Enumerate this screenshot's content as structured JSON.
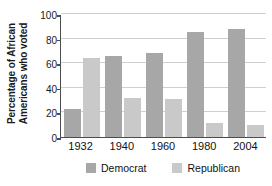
{
  "chart_data": {
    "type": "bar",
    "title": "",
    "xlabel": "",
    "ylabel": "Percentage of African Americans who voted",
    "ylabel_lines": [
      "Percentage of African",
      "Americans who voted"
    ],
    "categories": [
      "1932",
      "1940",
      "1960",
      "1980",
      "2004"
    ],
    "series": [
      {
        "name": "Democrat",
        "color": "#a7a7a7",
        "values": [
          23,
          66,
          68,
          85,
          88
        ]
      },
      {
        "name": "Republican",
        "color": "#c9c9c9",
        "values": [
          64,
          32,
          31,
          11,
          10
        ]
      }
    ],
    "ylim": [
      0,
      100
    ],
    "yticks": [
      0,
      20,
      40,
      60,
      80,
      100
    ],
    "ytick_labels": [
      "0",
      "20",
      "40",
      "60",
      "80",
      "100"
    ],
    "grid": true,
    "grid_axis": "y",
    "legend_position": "bottom",
    "legend_entries": [
      "Democrat",
      "Republican"
    ]
  }
}
